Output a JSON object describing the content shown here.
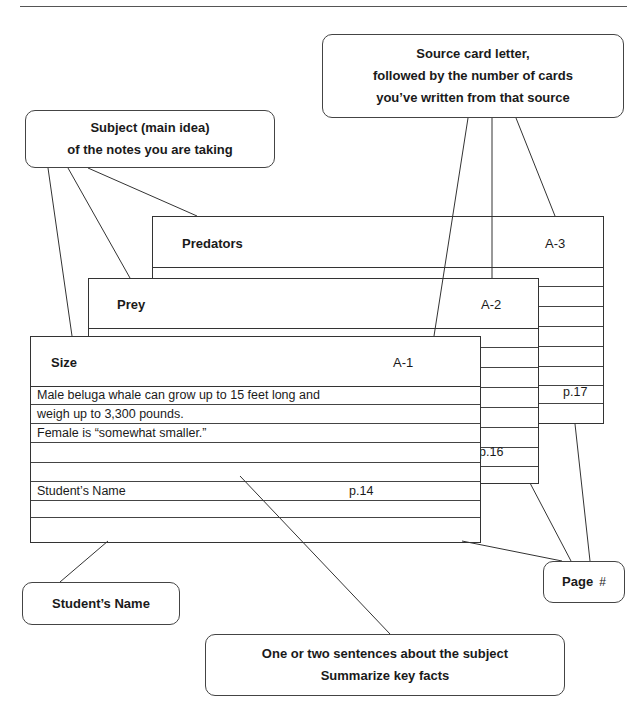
{
  "callouts": {
    "source": {
      "lines": [
        "Source card letter,",
        "followed by the number of cards",
        "you’ve written from that source"
      ]
    },
    "subject": {
      "lines": [
        "Subject (main idea)",
        "of the notes you are taking"
      ]
    },
    "student": {
      "label": "Student’s Name"
    },
    "page": {
      "label": "Page",
      "symbol": "#"
    },
    "summary": {
      "lines": [
        "One or two sentences about the subject",
        "Summarize key facts"
      ]
    }
  },
  "cards": [
    {
      "title": "Predators",
      "code": "A-3",
      "page": "p.17"
    },
    {
      "title": "Prey",
      "code": "A-2",
      "page": "p.16"
    },
    {
      "title": "Size",
      "code": "A-1",
      "page": "p.14",
      "rows": [
        "Male beluga whale can grow up to 15 feet long and",
        "weigh up to 3,300 pounds.",
        "Female is “somewhat smaller.”",
        "",
        "",
        "Student’s Name",
        "",
        ""
      ]
    }
  ]
}
